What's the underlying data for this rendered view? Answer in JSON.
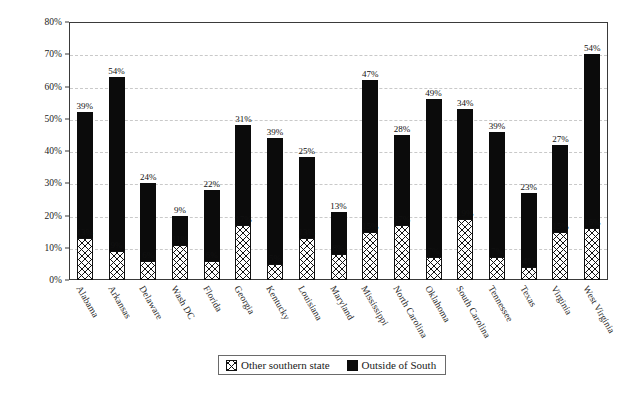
{
  "chart_data": {
    "type": "bar",
    "stacked": true,
    "title": "",
    "subtitle": "",
    "xlabel": "",
    "ylabel": "",
    "ylim": [
      0,
      80
    ],
    "ytick_labels": [
      "0%",
      "10%",
      "20%",
      "30%",
      "40%",
      "50%",
      "60%",
      "70%",
      "80%"
    ],
    "ytick_values": [
      0,
      10,
      20,
      30,
      40,
      50,
      60,
      70,
      80
    ],
    "grid": true,
    "grid_style": "dashed-horizontal",
    "legend_position": "bottom-center",
    "categories": [
      "Alabama",
      "Arkansas",
      "Delaware",
      "Wash DC",
      "Florida",
      "Georgia",
      "Kentucky",
      "Louisiana",
      "Maryland",
      "Mississippi",
      "North Carolina",
      "Oklahoma",
      "South Carolina",
      "Tennessee",
      "Texas",
      "Virginia",
      "West Virginia"
    ],
    "series": [
      {
        "name": "Other southern state",
        "pattern": "crosshatch",
        "color": "#ffffff",
        "edge_color": "#111111",
        "values": [
          13,
          9,
          6,
          11,
          6,
          17,
          5,
          13,
          8,
          15,
          17,
          7,
          19,
          7,
          4,
          15,
          16
        ],
        "value_labels": [
          "13%",
          "9%",
          "6%",
          "11%",
          "6%",
          "17%",
          "5%",
          "13%",
          "8%",
          "15%",
          "17%",
          "7%",
          "19%",
          "7%",
          "4%",
          "15%",
          "16%"
        ]
      },
      {
        "name": "Outside of South",
        "pattern": "solid",
        "color": "#0b0b0b",
        "edge_color": "#0b0b0b",
        "values": [
          39,
          54,
          24,
          9,
          22,
          31,
          39,
          25,
          13,
          47,
          28,
          49,
          34,
          39,
          23,
          27,
          54
        ],
        "value_labels": [
          "39%",
          "54%",
          "24%",
          "9%",
          "22%",
          "31%",
          "39%",
          "25%",
          "13%",
          "47%",
          "28%",
          "49%",
          "34%",
          "39%",
          "23%",
          "27%",
          "54%"
        ]
      }
    ],
    "totals": [
      52,
      63,
      30,
      20,
      28,
      48,
      44,
      38,
      21,
      62,
      45,
      56,
      53,
      46,
      27,
      42,
      70
    ]
  },
  "legend": {
    "items": [
      {
        "label": "Other southern state",
        "swatch": "crosshatch-swatch"
      },
      {
        "label": "Outside of South",
        "swatch": "black-swatch"
      }
    ]
  }
}
